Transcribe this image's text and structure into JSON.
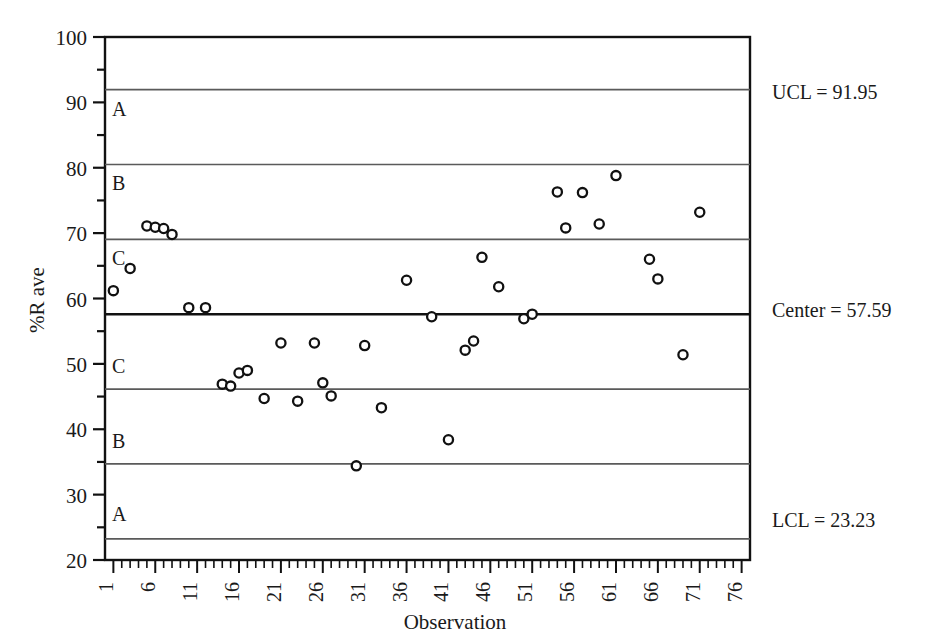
{
  "chart_data": {
    "type": "scatter",
    "title": "",
    "xlabel": "Observation",
    "ylabel": "%R ave",
    "xlim": [
      0,
      77
    ],
    "ylim": [
      20,
      100
    ],
    "ytick_values": [
      20,
      30,
      40,
      50,
      60,
      70,
      80,
      90,
      100
    ],
    "ytick_labels": [
      "20",
      "30",
      "40",
      "50",
      "60",
      "70",
      "80",
      "90",
      "100"
    ],
    "yminor_values": [
      25,
      35,
      45,
      55,
      65,
      75,
      85,
      95
    ],
    "xtick_values": [
      1,
      6,
      11,
      16,
      21,
      26,
      31,
      36,
      41,
      46,
      51,
      56,
      61,
      66,
      71,
      76
    ],
    "xtick_labels": [
      "1",
      "6",
      "11",
      "16",
      "21",
      "26",
      "31",
      "36",
      "41",
      "46",
      "51",
      "56",
      "61",
      "66",
      "71",
      "76"
    ],
    "grid": false,
    "legend": "none",
    "control_limits": {
      "ucl": 91.95,
      "center": 57.59,
      "lcl": 23.23,
      "ucl_label": "UCL = 91.95",
      "center_label": "Center = 57.59",
      "lcl_label": "LCL = 23.23"
    },
    "zone_boundaries": [
      91.95,
      80.5,
      69.05,
      57.59,
      46.14,
      34.69,
      23.23
    ],
    "zone_letters_upper": [
      "A",
      "B",
      "C"
    ],
    "zone_letters_lower": [
      "C",
      "B",
      "A"
    ],
    "zone_letter_positions": [
      {
        "label": "A",
        "y": 89.0
      },
      {
        "label": "B",
        "y": 77.6
      },
      {
        "label": "C",
        "y": 66.2
      },
      {
        "label": "C",
        "y": 49.6
      },
      {
        "label": "B",
        "y": 38.2
      },
      {
        "label": "A",
        "y": 27.0
      }
    ],
    "series": [
      {
        "name": "%R ave",
        "marker": "open-circle",
        "color": "#111111",
        "points": [
          {
            "x": 1,
            "y": 61.2
          },
          {
            "x": 3,
            "y": 64.6
          },
          {
            "x": 5,
            "y": 71.1
          },
          {
            "x": 6,
            "y": 70.9
          },
          {
            "x": 7,
            "y": 70.7
          },
          {
            "x": 8,
            "y": 69.8
          },
          {
            "x": 10,
            "y": 58.6
          },
          {
            "x": 12,
            "y": 58.6
          },
          {
            "x": 14,
            "y": 46.9
          },
          {
            "x": 15,
            "y": 46.6
          },
          {
            "x": 16,
            "y": 48.6
          },
          {
            "x": 17,
            "y": 49.0
          },
          {
            "x": 19,
            "y": 44.7
          },
          {
            "x": 21,
            "y": 53.2
          },
          {
            "x": 23,
            "y": 44.3
          },
          {
            "x": 25,
            "y": 53.2
          },
          {
            "x": 26,
            "y": 47.1
          },
          {
            "x": 27,
            "y": 45.1
          },
          {
            "x": 30,
            "y": 34.4
          },
          {
            "x": 31,
            "y": 52.8
          },
          {
            "x": 33,
            "y": 43.3
          },
          {
            "x": 36,
            "y": 62.8
          },
          {
            "x": 39,
            "y": 57.2
          },
          {
            "x": 41,
            "y": 38.4
          },
          {
            "x": 43,
            "y": 52.1
          },
          {
            "x": 44,
            "y": 53.5
          },
          {
            "x": 45,
            "y": 66.3
          },
          {
            "x": 47,
            "y": 61.8
          },
          {
            "x": 50,
            "y": 56.9
          },
          {
            "x": 51,
            "y": 57.6
          },
          {
            "x": 54,
            "y": 76.3
          },
          {
            "x": 55,
            "y": 70.8
          },
          {
            "x": 57,
            "y": 76.2
          },
          {
            "x": 59,
            "y": 71.4
          },
          {
            "x": 61,
            "y": 78.8
          },
          {
            "x": 65,
            "y": 66.0
          },
          {
            "x": 66,
            "y": 63.0
          },
          {
            "x": 69,
            "y": 51.4
          },
          {
            "x": 71,
            "y": 73.2
          }
        ]
      }
    ]
  }
}
